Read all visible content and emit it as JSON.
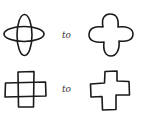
{
  "diagram": {
    "rows": [
      {
        "from": {
          "shape": "two-overlapping-ellipses",
          "description": "horizontal ellipse overlapping vertical ellipse"
        },
        "connector_label": "to",
        "to": {
          "shape": "rounded-four-lobed-outline",
          "description": "union outline of the two ellipses"
        }
      },
      {
        "from": {
          "shape": "two-overlapping-rectangles",
          "description": "horizontal rectangle overlapping vertical rectangle"
        },
        "connector_label": "to",
        "to": {
          "shape": "cross-outline",
          "description": "union outline of the two rectangles (plus sign)"
        }
      }
    ],
    "colors": {
      "stroke": "#1a1a1a",
      "background": "#ffffff",
      "label": "#333333"
    }
  }
}
